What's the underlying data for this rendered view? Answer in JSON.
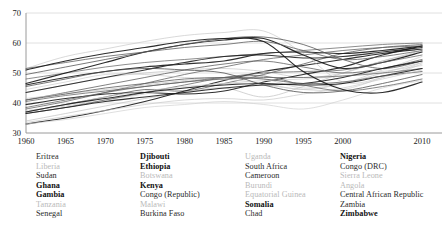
{
  "chart_data": {
    "type": "line",
    "title": "",
    "subtitle": "",
    "xlabel": "",
    "ylabel": "",
    "xlim": [
      1960,
      2011
    ],
    "ylim": [
      30,
      70
    ],
    "grid": true,
    "grid_axis": "y",
    "legend_position": "below",
    "x_ticks": [
      1960,
      1965,
      1970,
      1975,
      1980,
      1985,
      1990,
      1995,
      2000,
      2010
    ],
    "x_tick_labels": [
      "1960",
      "1965",
      "1970",
      "1975",
      "1980",
      "1985",
      "1990",
      "1995",
      "2000",
      "2010"
    ],
    "y_ticks": [
      30,
      40,
      50,
      60,
      70
    ],
    "y_tick_labels": [
      "30",
      "40",
      "50",
      "60",
      "70"
    ],
    "x": [
      1960,
      1965,
      1970,
      1975,
      1980,
      1985,
      1990,
      1995,
      2000,
      2005,
      2010
    ],
    "series": [
      {
        "name": "Eritrea",
        "emphasis": "normal",
        "color": "#555555",
        "values": [
          37.0,
          39.5,
          42.0,
          44.5,
          44.0,
          46.5,
          49.5,
          53.0,
          56.5,
          58.5,
          59.5
        ]
      },
      {
        "name": "Liberia",
        "emphasis": "light",
        "color": "#bdbdbd",
        "values": [
          34.0,
          36.5,
          39.0,
          41.5,
          43.5,
          45.0,
          42.0,
          45.5,
          50.0,
          54.0,
          57.0
        ]
      },
      {
        "name": "Sudan",
        "emphasis": "normal",
        "color": "#6a6a6a",
        "values": [
          48.0,
          50.0,
          52.0,
          53.5,
          54.5,
          55.5,
          56.5,
          57.5,
          58.5,
          59.5,
          60.0
        ]
      },
      {
        "name": "Ghana",
        "emphasis": "bold",
        "color": "#1a1a1a",
        "values": [
          46.0,
          48.5,
          50.5,
          52.0,
          53.0,
          54.0,
          56.5,
          57.0,
          56.5,
          57.5,
          59.0
        ]
      },
      {
        "name": "Gambia",
        "emphasis": "bold",
        "color": "#1a1a1a",
        "values": [
          33.0,
          35.0,
          37.5,
          40.5,
          44.0,
          47.5,
          50.5,
          52.5,
          54.5,
          56.5,
          58.0
        ]
      },
      {
        "name": "Tanzania",
        "emphasis": "light",
        "color": "#c2c2c2",
        "values": [
          43.5,
          46.0,
          48.5,
          50.0,
          51.0,
          51.5,
          50.5,
          48.5,
          50.0,
          54.0,
          57.5
        ]
      },
      {
        "name": "Senegal",
        "emphasis": "normal",
        "color": "#5f5f5f",
        "values": [
          38.0,
          40.5,
          43.5,
          46.5,
          49.5,
          52.0,
          54.5,
          56.0,
          57.5,
          58.5,
          59.0
        ]
      },
      {
        "name": "Djibouti",
        "emphasis": "bold",
        "color": "#202020",
        "values": [
          43.5,
          46.0,
          48.5,
          51.0,
          53.5,
          55.5,
          56.0,
          55.0,
          55.5,
          57.0,
          58.5
        ]
      },
      {
        "name": "Ethiopia",
        "emphasis": "bold",
        "color": "#1a1a1a",
        "values": [
          39.5,
          41.5,
          43.0,
          43.5,
          43.0,
          44.0,
          47.0,
          49.5,
          52.0,
          56.0,
          59.0
        ]
      },
      {
        "name": "Botswana",
        "emphasis": "light",
        "color": "#c5c5c5",
        "values": [
          51.5,
          55.5,
          58.0,
          60.5,
          62.5,
          63.5,
          64.0,
          56.5,
          47.0,
          48.5,
          53.0
        ]
      },
      {
        "name": "Kenya",
        "emphasis": "bold",
        "color": "#151515",
        "values": [
          46.5,
          50.0,
          53.5,
          57.0,
          59.5,
          61.0,
          61.5,
          56.0,
          51.5,
          53.5,
          57.0
        ]
      },
      {
        "name": "Congo (Republic)",
        "emphasis": "normal",
        "color": "#5a5a5a",
        "values": [
          51.5,
          53.5,
          55.5,
          57.0,
          58.5,
          59.5,
          60.5,
          57.5,
          54.5,
          55.5,
          57.5
        ]
      },
      {
        "name": "Malawi",
        "emphasis": "light",
        "color": "#c8c8c8",
        "values": [
          37.5,
          39.0,
          41.0,
          43.0,
          45.0,
          46.5,
          46.0,
          44.5,
          44.5,
          48.5,
          53.5
        ]
      },
      {
        "name": "Burkina Faso",
        "emphasis": "normal",
        "color": "#616161",
        "values": [
          36.5,
          38.5,
          41.0,
          43.5,
          46.0,
          48.5,
          50.0,
          50.5,
          51.0,
          53.5,
          56.0
        ]
      },
      {
        "name": "Uganda",
        "emphasis": "light",
        "color": "#c9c9c9",
        "values": [
          44.5,
          47.0,
          49.5,
          49.5,
          48.5,
          48.0,
          46.5,
          44.5,
          46.5,
          51.0,
          55.5
        ]
      },
      {
        "name": "South Africa",
        "emphasis": "normal",
        "color": "#4f4f4f",
        "values": [
          49.5,
          52.0,
          54.5,
          57.0,
          59.5,
          61.5,
          62.0,
          59.5,
          54.5,
          51.5,
          54.0
        ]
      },
      {
        "name": "Cameroon",
        "emphasis": "normal",
        "color": "#595959",
        "values": [
          41.0,
          43.5,
          46.0,
          48.5,
          51.0,
          53.0,
          54.0,
          52.0,
          50.0,
          51.5,
          54.5
        ]
      },
      {
        "name": "Burundi",
        "emphasis": "light",
        "color": "#c3c3c3",
        "values": [
          41.5,
          43.0,
          44.5,
          46.0,
          47.5,
          48.5,
          48.0,
          45.0,
          46.5,
          50.0,
          53.5
        ]
      },
      {
        "name": "Equatorial Guinea",
        "emphasis": "light",
        "color": "#cccccc",
        "values": [
          37.0,
          39.5,
          42.0,
          44.0,
          45.5,
          46.5,
          47.5,
          48.0,
          49.0,
          50.5,
          52.5
        ]
      },
      {
        "name": "Somalia",
        "emphasis": "bold",
        "color": "#1d1d1d",
        "values": [
          36.5,
          38.5,
          40.5,
          42.0,
          43.5,
          45.0,
          46.0,
          46.5,
          48.5,
          51.5,
          54.0
        ]
      },
      {
        "name": "Chad",
        "emphasis": "normal",
        "color": "#636363",
        "values": [
          40.5,
          42.5,
          44.0,
          45.5,
          47.0,
          48.0,
          48.5,
          48.5,
          49.0,
          50.0,
          51.5
        ]
      },
      {
        "name": "Nigeria",
        "emphasis": "bold",
        "color": "#1a1a1a",
        "values": [
          37.0,
          39.5,
          41.5,
          43.5,
          45.0,
          46.0,
          46.5,
          46.0,
          46.5,
          49.0,
          51.5
        ]
      },
      {
        "name": "Congo (DRC)",
        "emphasis": "normal",
        "color": "#565656",
        "values": [
          41.0,
          43.0,
          45.0,
          46.5,
          48.0,
          48.5,
          48.0,
          46.5,
          47.0,
          49.0,
          50.5
        ]
      },
      {
        "name": "Sierra Leone",
        "emphasis": "light",
        "color": "#cfcfcf",
        "values": [
          33.0,
          34.5,
          36.5,
          38.5,
          39.5,
          40.5,
          39.5,
          38.0,
          41.0,
          45.0,
          47.5
        ]
      },
      {
        "name": "Angola",
        "emphasis": "light",
        "color": "#c7c7c7",
        "values": [
          33.5,
          35.5,
          37.5,
          39.5,
          41.0,
          41.5,
          41.0,
          43.0,
          45.0,
          48.0,
          51.0
        ]
      },
      {
        "name": "Central African Republic",
        "emphasis": "normal",
        "color": "#606060",
        "values": [
          38.5,
          41.0,
          43.5,
          45.5,
          47.0,
          48.5,
          49.0,
          46.0,
          44.0,
          45.5,
          48.0
        ]
      },
      {
        "name": "Zambia",
        "emphasis": "normal",
        "color": "#4a4a4a",
        "values": [
          45.5,
          48.0,
          50.5,
          51.5,
          51.0,
          50.0,
          46.0,
          43.5,
          44.0,
          46.5,
          49.5
        ]
      },
      {
        "name": "Zimbabwe",
        "emphasis": "bold",
        "color": "#151515",
        "values": [
          51.0,
          54.0,
          56.5,
          58.5,
          60.5,
          61.5,
          60.5,
          50.5,
          44.5,
          43.5,
          47.0
        ]
      }
    ]
  },
  "legend": {
    "columns": [
      {
        "items": [
          {
            "label": "Eritrea",
            "emphasis": "normal"
          },
          {
            "label": "Liberia",
            "emphasis": "light"
          },
          {
            "label": "Sudan",
            "emphasis": "normal"
          },
          {
            "label": "Ghana",
            "emphasis": "bold"
          },
          {
            "label": "Gambia",
            "emphasis": "bold"
          },
          {
            "label": "Tanzania",
            "emphasis": "light"
          },
          {
            "label": "Senegal",
            "emphasis": "normal"
          }
        ]
      },
      {
        "items": [
          {
            "label": "Djibouti",
            "emphasis": "bold"
          },
          {
            "label": "Ethiopia",
            "emphasis": "bold"
          },
          {
            "label": "Botswana",
            "emphasis": "light"
          },
          {
            "label": "Kenya",
            "emphasis": "bold"
          },
          {
            "label": "Congo (Republic)",
            "emphasis": "normal"
          },
          {
            "label": "Malawi",
            "emphasis": "light"
          },
          {
            "label": "Burkina Faso",
            "emphasis": "normal"
          }
        ]
      },
      {
        "items": [
          {
            "label": "Uganda",
            "emphasis": "light"
          },
          {
            "label": "South Africa",
            "emphasis": "normal"
          },
          {
            "label": "Cameroon",
            "emphasis": "normal"
          },
          {
            "label": "Burundi",
            "emphasis": "light"
          },
          {
            "label": "Equatorial Guinea",
            "emphasis": "light"
          },
          {
            "label": "Somalia",
            "emphasis": "bold"
          },
          {
            "label": "Chad",
            "emphasis": "normal"
          }
        ]
      },
      {
        "items": [
          {
            "label": "Nigeria",
            "emphasis": "bold"
          },
          {
            "label": "Congo (DRC)",
            "emphasis": "normal"
          },
          {
            "label": "Sierra Leone",
            "emphasis": "light"
          },
          {
            "label": "Angola",
            "emphasis": "light"
          },
          {
            "label": "Central African Republic",
            "emphasis": "normal"
          },
          {
            "label": "Zambia",
            "emphasis": "normal"
          },
          {
            "label": "Zimbabwe",
            "emphasis": "bold"
          }
        ]
      }
    ]
  },
  "colors": {
    "axis": "#9a9a9a",
    "grid": "#d8d8d8",
    "tick_text": "#222222",
    "background": "#ffffff"
  }
}
